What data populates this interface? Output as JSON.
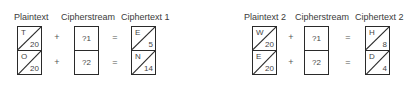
{
  "diagrams": [
    {
      "labels": {
        "plaintext": "Plaintext",
        "cipherstream": "Cipherstream",
        "ciphertext": "Ciphertext 1"
      },
      "plaintext": [
        {
          "letter": "T",
          "value": "20"
        },
        {
          "letter": "O",
          "value": "20"
        }
      ],
      "cipherstream": [
        {
          "value": "?1"
        },
        {
          "value": "?2"
        }
      ],
      "ciphertext": [
        {
          "letter": "E",
          "value": "5"
        },
        {
          "letter": "N",
          "value": "14"
        }
      ],
      "operators": {
        "plus": "+",
        "equals": "="
      }
    },
    {
      "labels": {
        "plaintext": "Plaintext 2",
        "cipherstream": "Cipherstream",
        "ciphertext": "Ciphertext 2"
      },
      "plaintext": [
        {
          "letter": "W",
          "value": "20"
        },
        {
          "letter": "E",
          "value": "20"
        }
      ],
      "cipherstream": [
        {
          "value": "?1"
        },
        {
          "value": "?2"
        }
      ],
      "ciphertext": [
        {
          "letter": "H",
          "value": "8"
        },
        {
          "letter": "D",
          "value": "4"
        }
      ],
      "operators": {
        "plus": "+",
        "equals": "="
      }
    }
  ]
}
